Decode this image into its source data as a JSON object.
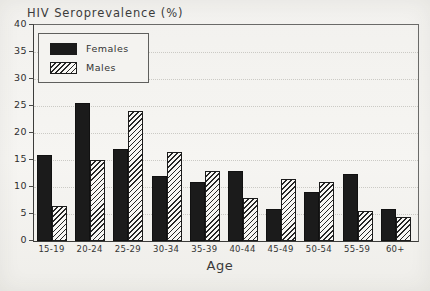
{
  "title": "HIV Seroprevalence (%)",
  "legend": {
    "items": [
      {
        "label": "Females",
        "swatch": "solid-black"
      },
      {
        "label": "Males",
        "swatch": "diagonal-hatch"
      }
    ]
  },
  "chart_data": {
    "type": "bar",
    "title": "HIV Seroprevalence (%)",
    "xlabel": "Age",
    "ylabel": "HIV Seroprevalence (%)",
    "categories": [
      "15-19",
      "20-24",
      "25-29",
      "30-34",
      "35-39",
      "40-44",
      "45-49",
      "50-54",
      "55-59",
      "60+"
    ],
    "series": [
      {
        "name": "Females",
        "style": "solid-black",
        "values": [
          16,
          25.5,
          17,
          12,
          11,
          13,
          6,
          9,
          12.5,
          6
        ]
      },
      {
        "name": "Males",
        "style": "diagonal-hatch",
        "values": [
          6.5,
          15,
          24,
          16.5,
          13,
          8,
          11.5,
          11,
          5.5,
          4.5
        ]
      }
    ],
    "ylim": [
      0,
      40
    ],
    "yticks": [
      0,
      5,
      10,
      15,
      20,
      25,
      30,
      35,
      40
    ],
    "grid": "horizontal-dotted",
    "legend_position": "upper-left"
  },
  "colors": {
    "bar_females": "#1b1b1b",
    "bar_males_hatch": "#262626",
    "frame": "#4a4a48",
    "gridline": "#cbcac5",
    "text": "#2e2e2e",
    "paper": "#f2f1ee"
  }
}
